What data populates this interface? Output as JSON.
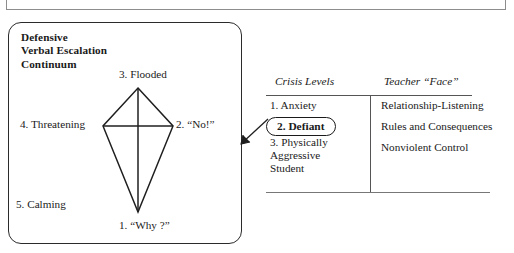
{
  "figure": {
    "left_panel": {
      "title": "Defensive\nVerbal Escalation\nContinuum",
      "kite_labels": {
        "flooded": "3. Flooded",
        "threatening": "4. Threatening",
        "no": "2. “No!”",
        "calming": "5. Calming",
        "why": "1. “Why ?”"
      }
    },
    "connector": {
      "icon": "arrow-left-icon"
    },
    "table": {
      "headers": {
        "crisis_levels": "Crisis Levels",
        "teacher_face": "Teacher “Face”"
      },
      "rows": [
        {
          "crisis_level": "1. Anxiety",
          "teacher_face": "Relationship-Listening",
          "highlighted": false
        },
        {
          "crisis_level": "2. Defiant",
          "teacher_face": "Rules and Consequences",
          "highlighted": true
        },
        {
          "crisis_level": "3. Physically\nAggressive\nStudent",
          "teacher_face": "Nonviolent Control",
          "highlighted": false
        }
      ]
    },
    "colors": {
      "ink": "#1a1a1a",
      "rule": "#555555",
      "panel_border": "#2b2b2b",
      "top_bar_border": "#8d8d8d"
    }
  }
}
